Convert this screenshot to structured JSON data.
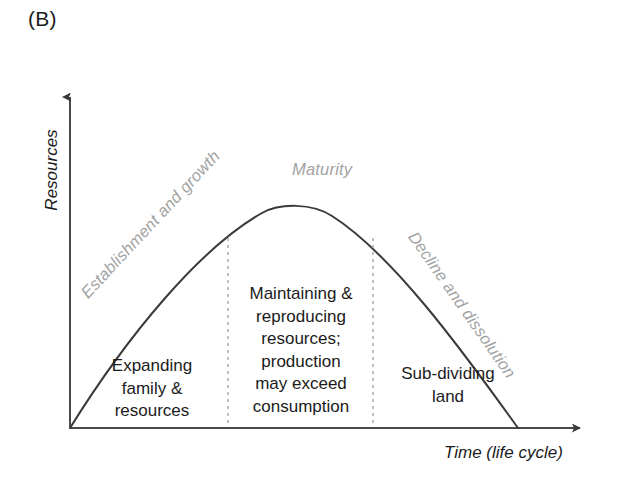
{
  "panel": {
    "label": "(B)"
  },
  "axes": {
    "y_title": "Resources",
    "x_title": "Time (life cycle)"
  },
  "phases": [
    {
      "id": "establishment",
      "label": "Establishment and growth"
    },
    {
      "id": "maturity",
      "label": "Maturity"
    },
    {
      "id": "decline",
      "label": "Decline and dissolution"
    }
  ],
  "regions": [
    {
      "id": "region-1",
      "lines": [
        "Expanding",
        "family &",
        "resources"
      ]
    },
    {
      "id": "region-2",
      "lines": [
        "Maintaining &",
        "reproducing",
        "resources;",
        "production",
        "may exceed",
        "consumption"
      ]
    },
    {
      "id": "region-3",
      "lines": [
        "Sub-dividing",
        "land"
      ]
    }
  ],
  "colors": {
    "curve": "#3a3a3a",
    "axis": "#4a4a4a",
    "phase_label": "#a3a3a3",
    "divider": "#b0b0b0",
    "text": "#1b1b1b",
    "background": "#ffffff"
  },
  "chart_data": {
    "type": "line",
    "title": "(B)",
    "xlabel": "Time (life cycle)",
    "ylabel": "Resources",
    "grid": false,
    "legend": "none",
    "xlim": [
      0,
      100
    ],
    "ylim": [
      0,
      100
    ],
    "annotations": [
      "Establishment and growth",
      "Maturity",
      "Decline and dissolution",
      "Expanding family & resources",
      "Maintaining & reproducing resources; production may exceed consumption",
      "Sub-dividing land"
    ],
    "dividers_x": [
      35,
      68
    ],
    "series": [
      {
        "name": "Resources over life cycle",
        "x": [
          0,
          5,
          10,
          15,
          20,
          25,
          30,
          35,
          40,
          45,
          50,
          52,
          55,
          60,
          65,
          70,
          75,
          80,
          85,
          90,
          95,
          100
        ],
        "y": [
          0,
          13,
          26,
          37,
          47,
          56,
          64,
          71,
          77,
          82,
          85,
          86,
          85,
          82,
          77,
          71,
          63,
          53,
          42,
          29,
          15,
          0
        ]
      }
    ]
  }
}
